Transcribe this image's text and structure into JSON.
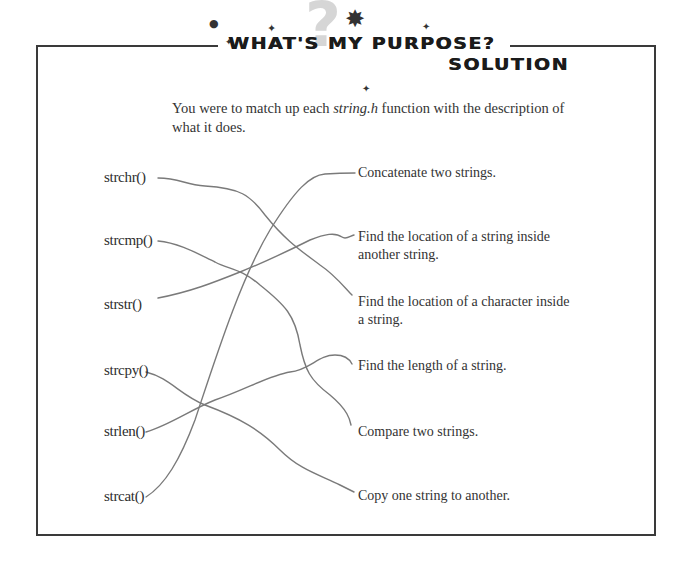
{
  "header": {
    "title": "WHAT'S MY PURPOSE?",
    "subtitle": "SOLUTION",
    "question_mark": "?",
    "sparkles": [
      "✦",
      "✦",
      "✦",
      "✸"
    ]
  },
  "intro": {
    "before": "You were to match up each ",
    "emphasis": "string.h",
    "after": " function with the description of what it does."
  },
  "functions": [
    {
      "name": "strchr()"
    },
    {
      "name": "strcmp()"
    },
    {
      "name": "strstr()"
    },
    {
      "name": "strcpy()"
    },
    {
      "name": "strlen()"
    },
    {
      "name": "strcat()"
    }
  ],
  "descriptions": [
    {
      "text": "Concatenate two strings."
    },
    {
      "text": "Find the location of a string inside another string."
    },
    {
      "text": "Find the location of a character inside a string."
    },
    {
      "text": "Find the length of a string."
    },
    {
      "text": "Compare two strings."
    },
    {
      "text": "Copy one string to another."
    }
  ],
  "matches": [
    {
      "function": "strchr()",
      "description": "Find the location of a character inside a string."
    },
    {
      "function": "strcmp()",
      "description": "Compare two strings."
    },
    {
      "function": "strstr()",
      "description": "Find the location of a string inside another string."
    },
    {
      "function": "strcpy()",
      "description": "Copy one string to another."
    },
    {
      "function": "strlen()",
      "description": "Find the length of a string."
    },
    {
      "function": "strcat()",
      "description": "Concatenate two strings."
    }
  ],
  "colors": {
    "line": "#7a7a7a",
    "border": "#3a3a3a",
    "text": "#2e2e2e"
  }
}
